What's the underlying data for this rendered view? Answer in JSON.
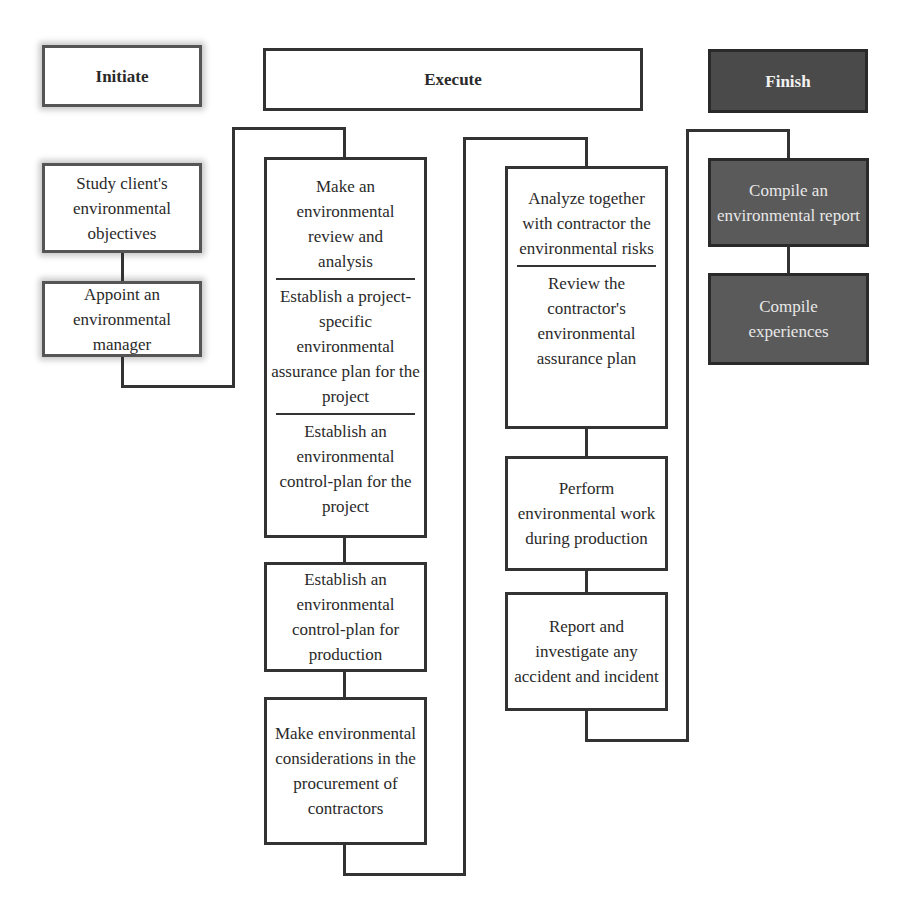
{
  "phases": {
    "initiate": "Initiate",
    "execute": "Execute",
    "finish": "Finish"
  },
  "initiate": {
    "steps": [
      "Study client's environmental objectives",
      "Appoint an environmental manager"
    ]
  },
  "execute": {
    "column1": {
      "box1": [
        "Make an environmental review and analysis",
        "Establish a project-specific environmental assurance plan for the project",
        "Establish an environmental control-plan for the project"
      ],
      "box2": "Establish an environmental control-plan for production",
      "box3": "Make environmental considerations in the procurement of contractors"
    },
    "column2": {
      "box1": [
        "Analyze together with contractor the environmental risks",
        "Review the contractor's environmental assurance plan"
      ],
      "box2": "Perform environmental work during production",
      "box3": "Report and investigate any accident and incident"
    }
  },
  "finish": {
    "steps": [
      "Compile an environmental report",
      "Compile experiences"
    ]
  },
  "colors": {
    "line": "#333333",
    "finish_fill": "#4a4a4a",
    "finish_step_fill": "#5a5a5a"
  }
}
